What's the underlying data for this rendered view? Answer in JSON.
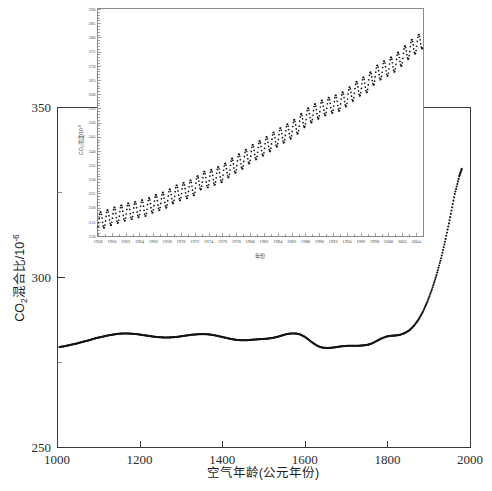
{
  "chart_data": {
    "type": "scatter",
    "title": "",
    "xlabel": "空气年龄(公元年份)",
    "ylabel_prefix": "CO",
    "ylabel_sub": "2",
    "ylabel_mid": "混合比/10",
    "ylabel_sup": "-6",
    "ylabel_full": "CO2混合比/10-6",
    "xlim": [
      1000,
      2000
    ],
    "ylim": [
      250,
      350
    ],
    "xticks": [
      1000,
      1200,
      1400,
      1600,
      1800,
      2000
    ],
    "yticks": [
      250,
      300,
      350
    ],
    "yticks_minor": [
      275,
      325
    ],
    "grid": false,
    "legend": false,
    "series_name": "冰芯 CO2 记录",
    "x": [
      1006,
      1017,
      1028,
      1039,
      1050,
      1061,
      1072,
      1083,
      1094,
      1105,
      1116,
      1127,
      1138,
      1149,
      1160,
      1171,
      1182,
      1193,
      1204,
      1215,
      1226,
      1237,
      1248,
      1259,
      1270,
      1281,
      1292,
      1303,
      1314,
      1325,
      1336,
      1347,
      1358,
      1369,
      1380,
      1391,
      1402,
      1413,
      1424,
      1435,
      1446,
      1457,
      1468,
      1479,
      1490,
      1501,
      1512,
      1523,
      1534,
      1545,
      1556,
      1567,
      1578,
      1589,
      1600,
      1611,
      1622,
      1633,
      1644,
      1655,
      1666,
      1677,
      1688,
      1699,
      1710,
      1721,
      1732,
      1743,
      1754,
      1765,
      1776,
      1787,
      1798,
      1809,
      1820,
      1831,
      1842,
      1853,
      1864,
      1875,
      1886,
      1897,
      1908,
      1919,
      1930,
      1941,
      1952,
      1963,
      1974,
      1980
    ],
    "y": [
      279.4,
      279.6,
      279.9,
      280.2,
      280.5,
      280.9,
      281.2,
      281.6,
      282.0,
      282.3,
      282.6,
      282.9,
      283.1,
      283.3,
      283.4,
      283.4,
      283.3,
      283.2,
      283.0,
      282.8,
      282.6,
      282.4,
      282.3,
      282.2,
      282.2,
      282.3,
      282.4,
      282.6,
      282.8,
      283.0,
      283.1,
      283.2,
      283.2,
      283.1,
      282.9,
      282.6,
      282.3,
      282.0,
      281.7,
      281.5,
      281.4,
      281.4,
      281.5,
      281.6,
      281.7,
      281.8,
      281.9,
      282.1,
      282.4,
      282.8,
      283.2,
      283.4,
      283.4,
      283.1,
      282.4,
      281.4,
      280.4,
      279.6,
      279.2,
      279.1,
      279.2,
      279.4,
      279.6,
      279.7,
      279.8,
      279.8,
      279.8,
      279.9,
      280.1,
      280.6,
      281.3,
      282.0,
      282.5,
      282.7,
      282.8,
      283.0,
      283.5,
      284.3,
      285.6,
      287.4,
      289.8,
      292.8,
      296.4,
      300.6,
      305.5,
      311.2,
      317.6,
      324.4,
      329.6,
      331.8
    ]
  },
  "inset_chart_data": {
    "type": "line",
    "title": "",
    "xlabel": "年份",
    "ylabel_prefix": "CO",
    "ylabel_sub": "2",
    "ylabel_mid": "浓度/10",
    "ylabel_sup": "-6",
    "ylabel_full": "CO2浓度/10-6",
    "xlim": [
      1958,
      2005
    ],
    "ylim": [
      310,
      390
    ],
    "xticks": [
      1958,
      1960,
      1962,
      1964,
      1966,
      1968,
      1970,
      1972,
      1974,
      1976,
      1978,
      1980,
      1982,
      1984,
      1986,
      1988,
      1990,
      1992,
      1994,
      1996,
      1998,
      2000,
      2002,
      2004
    ],
    "yticks": [
      310,
      315,
      320,
      325,
      330,
      335,
      340,
      345,
      350,
      355,
      360,
      365,
      370,
      375,
      380,
      385,
      390
    ],
    "grid": false,
    "legend": false,
    "series_name": "Mauna Loa 月均 CO2 浓度",
    "annual_mean_x": [
      1958,
      1959,
      1960,
      1961,
      1962,
      1963,
      1964,
      1965,
      1966,
      1967,
      1968,
      1969,
      1970,
      1971,
      1972,
      1973,
      1974,
      1975,
      1976,
      1977,
      1978,
      1979,
      1980,
      1981,
      1982,
      1983,
      1984,
      1985,
      1986,
      1987,
      1988,
      1989,
      1990,
      1991,
      1992,
      1993,
      1994,
      1995,
      1996,
      1997,
      1998,
      1999,
      2000,
      2001,
      2002,
      2003,
      2004
    ],
    "annual_mean_y": [
      315.3,
      315.9,
      316.9,
      317.6,
      318.4,
      318.9,
      319.6,
      320.0,
      321.3,
      322.1,
      323.0,
      324.6,
      325.6,
      326.3,
      327.4,
      329.6,
      330.1,
      331.1,
      332.0,
      333.8,
      335.4,
      336.8,
      338.7,
      340.1,
      341.4,
      343.0,
      344.6,
      346.0,
      347.4,
      349.2,
      351.6,
      353.1,
      354.4,
      355.6,
      356.4,
      357.1,
      358.8,
      360.8,
      362.6,
      363.7,
      366.6,
      368.3,
      369.5,
      371.0,
      373.1,
      375.6,
      377.4
    ],
    "seasonal_amplitude": 3.0
  },
  "figure": {
    "caption": "",
    "background_color": "#ffffff",
    "data_color": "#141414",
    "axis_color": "#3a3a3a",
    "inset_frame_color": "#8a8a8a"
  }
}
